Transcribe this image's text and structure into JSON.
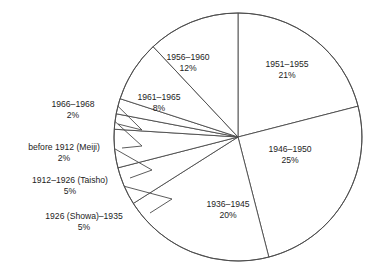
{
  "chart_data": {
    "type": "pie",
    "title": "",
    "subtitle": "",
    "xlabel": "",
    "ylabel": "",
    "legend_position": "none",
    "grid": false,
    "labels_show_percent": true,
    "total_percent": 98,
    "categories": [
      "1951–1955",
      "1946–1950",
      "1936–1945",
      "1926 (Showa)–1935",
      "1912–1926 (Taisho)",
      "before 1912 (Meiji)",
      "1966–1968",
      "1961–1965",
      "1956–1960"
    ],
    "values": [
      21,
      25,
      20,
      5,
      5,
      2,
      2,
      8,
      12
    ],
    "slices": [
      {
        "name": "1951–1955",
        "percent": 21,
        "percent_text": "21%",
        "placement": "inside",
        "label_x": 287,
        "label_y": 67,
        "start_angle_deg": 0,
        "end_angle_deg": 75.6
      },
      {
        "name": "1946–1950",
        "percent": 25,
        "percent_text": "25%",
        "placement": "inside",
        "label_x": 290,
        "label_y": 152,
        "start_angle_deg": 75.6,
        "end_angle_deg": 165.6
      },
      {
        "name": "1936–1945",
        "percent": 20,
        "percent_text": "20%",
        "placement": "inside",
        "label_x": 228,
        "label_y": 207,
        "start_angle_deg": 165.6,
        "end_angle_deg": 237.6
      },
      {
        "name": "1926 (Showa)–1935",
        "percent": 5,
        "percent_text": "5%",
        "placement": "callout",
        "label_x": 84,
        "label_y": 219,
        "label_anchor": "middle",
        "start_angle_deg": 237.6,
        "end_angle_deg": 255.6,
        "leader_from_x": 150,
        "leader_from_y": 213,
        "leader_to_x": 172,
        "leader_to_y": 199
      },
      {
        "name": "1912–1926 (Taisho)",
        "percent": 5,
        "percent_text": "5%",
        "placement": "callout",
        "label_x": 70,
        "label_y": 183,
        "label_anchor": "middle",
        "start_angle_deg": 255.6,
        "end_angle_deg": 273.6,
        "leader_from_x": 130,
        "leader_from_y": 178,
        "leader_to_x": 152,
        "leader_to_y": 170
      },
      {
        "name": "before 1912 (Meiji)",
        "percent": 2,
        "percent_text": "2%",
        "placement": "callout",
        "label_x": 64,
        "label_y": 150,
        "label_anchor": "middle",
        "start_angle_deg": 273.6,
        "end_angle_deg": 280.8,
        "leader_from_x": 122,
        "leader_from_y": 148,
        "leader_to_x": 142,
        "leader_to_y": 146
      },
      {
        "name": "1966–1968",
        "percent": 2,
        "percent_text": "2%",
        "placement": "callout",
        "label_x": 73,
        "label_y": 107,
        "label_anchor": "middle",
        "start_angle_deg": 280.8,
        "end_angle_deg": 288,
        "leader_from_x": 118,
        "leader_from_y": 124,
        "leader_to_x": 142,
        "leader_to_y": 130
      },
      {
        "name": "1961–1965",
        "percent": 8,
        "percent_text": "8%",
        "placement": "inside",
        "label_x": 159,
        "label_y": 100,
        "start_angle_deg": 288,
        "end_angle_deg": 316.8
      },
      {
        "name": "1956–1960",
        "percent": 12,
        "percent_text": "12%",
        "placement": "inside",
        "label_x": 188,
        "label_y": 60,
        "start_angle_deg": 316.8,
        "end_angle_deg": 360
      }
    ],
    "geometry": {
      "center_x": 238,
      "center_y": 137,
      "radius": 124
    },
    "colors": {
      "slice_fill": "#ffffff",
      "slice_stroke": "#4a4a4a",
      "text": "#1d1d1d",
      "background": "#ffffff"
    }
  }
}
